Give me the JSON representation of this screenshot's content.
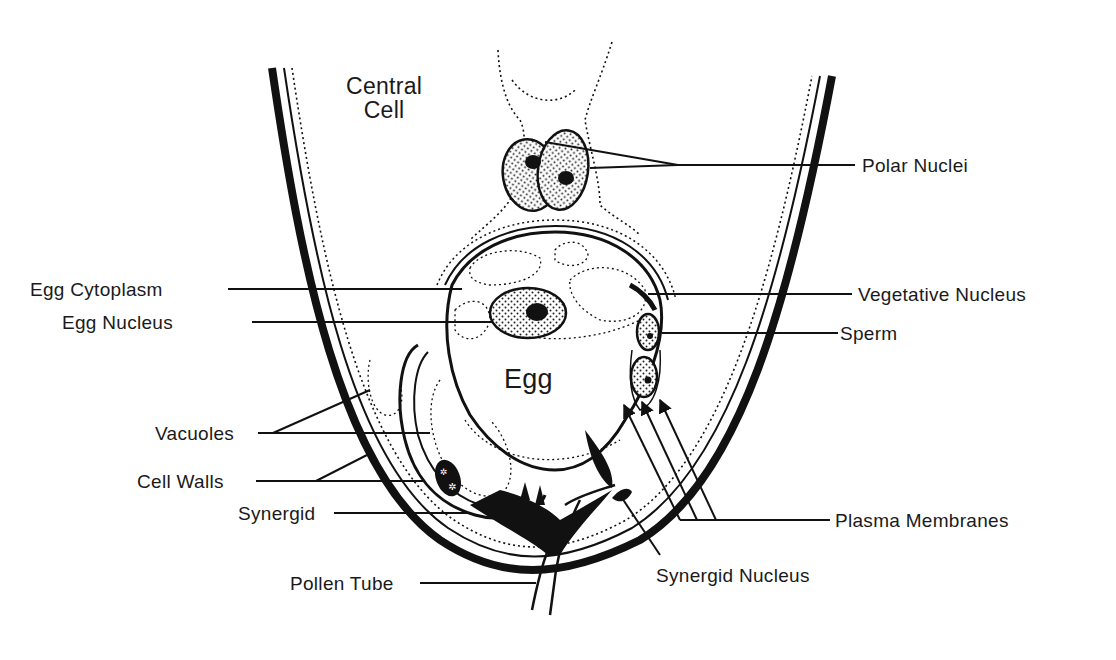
{
  "figure": {
    "type": "labeled biological diagram",
    "colors": {
      "ink": "#111111",
      "paper": "#ffffff"
    }
  },
  "inner_labels": {
    "central_cell_line1": "Central",
    "central_cell_line2": "Cell",
    "egg": "Egg"
  },
  "callouts_left": [
    {
      "id": "egg-cytoplasm",
      "label": "Egg Cytoplasm"
    },
    {
      "id": "egg-nucleus",
      "label": "Egg Nucleus"
    },
    {
      "id": "vacuoles",
      "label": "Vacuoles"
    },
    {
      "id": "cell-walls",
      "label": "Cell Walls"
    },
    {
      "id": "synergid",
      "label": "Synergid"
    },
    {
      "id": "pollen-tube",
      "label": "Pollen Tube"
    }
  ],
  "callouts_right": [
    {
      "id": "polar-nuclei",
      "label": "Polar Nuclei"
    },
    {
      "id": "vegetative-nucleus",
      "label": "Vegetative Nucleus"
    },
    {
      "id": "sperm",
      "label": "Sperm"
    },
    {
      "id": "plasma-membranes",
      "label": "Plasma Membranes"
    },
    {
      "id": "synergid-nucleus",
      "label": "Synergid Nucleus"
    }
  ]
}
